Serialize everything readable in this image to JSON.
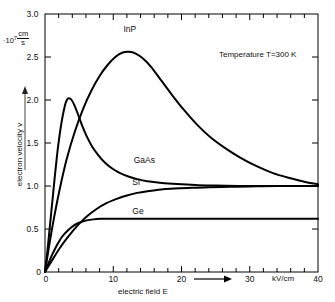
{
  "chart_data": {
    "type": "line",
    "title": "",
    "xlabel": "electric field E",
    "ylabel": "electron velocity v",
    "x_unit": "kV/cm",
    "y_unit_mantissa": "10",
    "y_unit_exponent": "7",
    "y_unit_numerator": "cm",
    "y_unit_denominator": "s",
    "xlim": [
      0,
      40
    ],
    "ylim": [
      0,
      3.0
    ],
    "xticks": [
      0,
      10,
      20,
      30,
      40
    ],
    "xtick_labels": [
      "0",
      "10",
      "20",
      "30",
      "40"
    ],
    "x_minor_tick_step": 2,
    "yticks": [
      0,
      0.5,
      1.0,
      1.5,
      2.0,
      2.5,
      3.0
    ],
    "ytick_labels": [
      "0",
      "0.5",
      "1.0",
      "1.5",
      "2.0",
      "2.5",
      "3.0"
    ],
    "grid": false,
    "legend_position": "inline-curve-labels",
    "annotations": [
      {
        "name": "temperature",
        "text": "Temperature T=300 K",
        "x": 26.5,
        "y": 2.62
      }
    ],
    "series": [
      {
        "name": "InP",
        "label": "InP",
        "label_x": 11.5,
        "label_y": 2.82,
        "peak_x": 12.3,
        "peak_y": 2.56,
        "x": [
          0,
          0.6,
          1.3,
          2.2,
          3.2,
          4.4,
          5.6,
          6.8,
          8.0,
          9.2,
          10.3,
          11.3,
          12.3,
          13.3,
          14.4,
          15.6,
          17.0,
          18.6,
          20.3,
          22.2,
          24.2,
          26.4,
          28.6,
          31.0,
          33.4,
          36.0,
          38.0,
          40
        ],
        "y": [
          0,
          0.3,
          0.62,
          0.98,
          1.32,
          1.64,
          1.9,
          2.11,
          2.28,
          2.41,
          2.5,
          2.55,
          2.56,
          2.54,
          2.48,
          2.38,
          2.23,
          2.06,
          1.89,
          1.72,
          1.57,
          1.44,
          1.33,
          1.23,
          1.15,
          1.09,
          1.05,
          1.02
        ]
      },
      {
        "name": "GaAs",
        "label": "GaAs",
        "label_x": 13.0,
        "label_y": 1.3,
        "peak_x": 3.5,
        "peak_y": 2.02,
        "x": [
          0,
          0.4,
          0.9,
          1.4,
          1.9,
          2.4,
          2.9,
          3.2,
          3.5,
          3.9,
          4.3,
          4.8,
          5.4,
          6.1,
          6.9,
          7.8,
          8.8,
          9.9,
          11.0,
          12.2,
          13.5,
          15.0,
          16.5,
          18.0,
          20.0,
          22.5,
          25.0,
          30.0,
          35.0,
          40
        ],
        "y": [
          0,
          0.28,
          0.68,
          1.08,
          1.45,
          1.73,
          1.93,
          2.0,
          2.02,
          2.0,
          1.94,
          1.84,
          1.71,
          1.58,
          1.46,
          1.36,
          1.27,
          1.2,
          1.15,
          1.11,
          1.08,
          1.055,
          1.04,
          1.03,
          1.02,
          1.01,
          1.005,
          1.0,
          1.0,
          1.0
        ]
      },
      {
        "name": "Si",
        "label": "Si",
        "label_x": 12.8,
        "label_y": 1.05,
        "saturation": 1.0,
        "x": [
          0,
          0.6,
          1.3,
          2.1,
          3.0,
          4.0,
          5.0,
          6.2,
          7.5,
          9.0,
          10.5,
          12.0,
          13.5,
          15.0,
          17.0,
          19.0,
          21.5,
          24.0,
          27.0,
          30.0,
          34.0,
          40
        ],
        "y": [
          0,
          0.08,
          0.17,
          0.27,
          0.37,
          0.47,
          0.56,
          0.65,
          0.73,
          0.8,
          0.85,
          0.89,
          0.92,
          0.94,
          0.96,
          0.97,
          0.98,
          0.985,
          0.99,
          0.995,
          1.0,
          1.0
        ]
      },
      {
        "name": "Ge",
        "label": "Ge",
        "label_x": 12.8,
        "label_y": 0.71,
        "saturation": 0.62,
        "x": [
          0,
          0.5,
          1.1,
          1.8,
          2.5,
          3.3,
          4.2,
          5.1,
          6.1,
          7.1,
          8.2,
          9.3,
          10.5,
          12.0,
          14.0,
          16.0,
          20.0,
          25.0,
          30.0,
          35.0,
          40
        ],
        "y": [
          0,
          0.1,
          0.21,
          0.32,
          0.41,
          0.48,
          0.54,
          0.575,
          0.6,
          0.612,
          0.618,
          0.62,
          0.62,
          0.62,
          0.62,
          0.62,
          0.62,
          0.62,
          0.62,
          0.62,
          0.62
        ]
      }
    ]
  }
}
